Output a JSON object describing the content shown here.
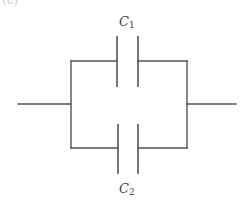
{
  "diagram": {
    "type": "circuit",
    "figure_label_fragment": "(c)",
    "components": [
      {
        "id": "C1",
        "kind": "capacitor",
        "label_main": "C",
        "label_sub": "1",
        "branch": "top"
      },
      {
        "id": "C2",
        "kind": "capacitor",
        "label_main": "C",
        "label_sub": "2",
        "branch": "bottom"
      }
    ],
    "connection": "parallel",
    "colors": {
      "wire": "#555555",
      "label": "#444444",
      "background": "#ffffff"
    }
  }
}
